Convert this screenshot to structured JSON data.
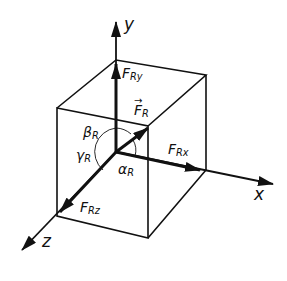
{
  "diagram": {
    "axes": {
      "x": "x",
      "y": "y",
      "z": "z"
    },
    "forces": {
      "resultant": {
        "symbol": "F",
        "subscript": "R",
        "has_vector_arrow": true
      },
      "x_component": {
        "symbol": "F",
        "subscript": "Rx"
      },
      "y_component": {
        "symbol": "F",
        "subscript": "Ry"
      },
      "z_component": {
        "symbol": "F",
        "subscript": "Rz"
      }
    },
    "angles": {
      "alpha": {
        "symbol": "α",
        "subscript": "R"
      },
      "beta": {
        "symbol": "β",
        "subscript": "R"
      },
      "gamma": {
        "symbol": "γ",
        "subscript": "R"
      }
    },
    "colors": {
      "line": "#111111",
      "background": "#ffffff"
    }
  }
}
